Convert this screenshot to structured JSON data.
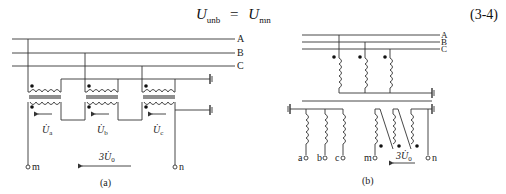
{
  "equation": {
    "lhs": "U",
    "lhs_sub": "unb",
    "equals": "=",
    "rhs": "U",
    "rhs_sub": "mn",
    "number": "(3-4)"
  },
  "figure_a": {
    "caption": "(a)",
    "bus_labels": [
      "A",
      "B",
      "C"
    ],
    "voltage_labels": [
      "U̇a",
      "U̇b",
      "U̇c"
    ],
    "voltage_symbols": [
      {
        "base": "U̇",
        "sub": "a"
      },
      {
        "base": "U̇",
        "sub": "b"
      },
      {
        "base": "U̇",
        "sub": "c"
      }
    ],
    "terminal_left": "m",
    "terminal_right": "n",
    "open_delta_voltage": "3U̇",
    "open_delta_sub": "0"
  },
  "figure_b": {
    "caption": "(b)",
    "bus_labels": [
      "A",
      "B",
      "C"
    ],
    "star_terminals": [
      "a",
      "b",
      "c"
    ],
    "terminal_left": "m",
    "terminal_right": "n",
    "open_delta_voltage": "3U̇",
    "open_delta_sub": "0"
  },
  "colors": {
    "line": "#333333",
    "text": "#222222",
    "background": "#ffffff"
  }
}
